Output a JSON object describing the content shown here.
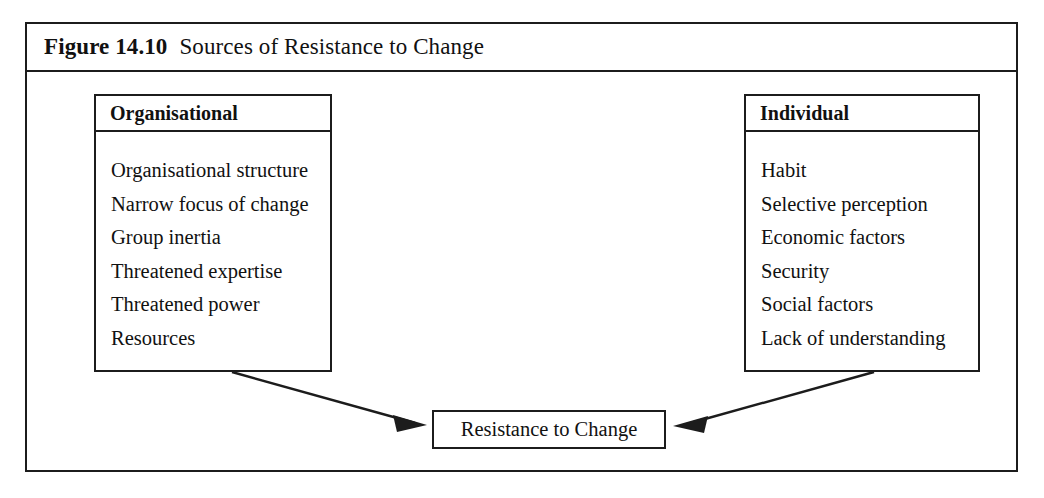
{
  "figure": {
    "number": "Figure 14.10",
    "title": "Sources of Resistance to Change"
  },
  "colors": {
    "ink": "#1c1c1c",
    "paper": "#ffffff"
  },
  "boxes": {
    "organisational": {
      "heading": "Organisational",
      "items": [
        "Organisational structure",
        "Narrow focus of change",
        "Group inertia",
        "Threatened expertise",
        "Threatened power",
        "Resources"
      ]
    },
    "individual": {
      "heading": "Individual",
      "items": [
        "Habit",
        "Selective perception",
        "Economic factors",
        "Security",
        "Social factors",
        "Lack of understanding"
      ]
    },
    "outcome": {
      "label": "Resistance to Change"
    }
  },
  "connectors": [
    {
      "name": "organisational-to-outcome",
      "from": "organisational",
      "to": "outcome",
      "direction": "down-right"
    },
    {
      "name": "individual-to-outcome",
      "from": "individual",
      "to": "outcome",
      "direction": "down-left"
    }
  ]
}
